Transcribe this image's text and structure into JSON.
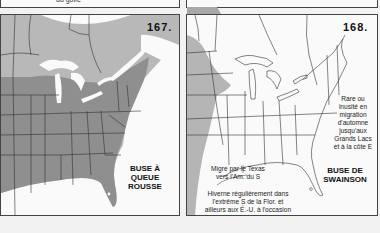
{
  "top_strip": {
    "caption": "du golfe"
  },
  "maps": [
    {
      "number": "167.",
      "species": [
        "BUSE À",
        "QUEUE",
        "ROUSSE"
      ],
      "colors": {
        "background": "#fafafa",
        "light_range": "#b8b8b8",
        "dark_range": "#8f8f8f",
        "border": "#333333"
      }
    },
    {
      "number": "168.",
      "species": [
        "BUSE DE",
        "SWAINSON"
      ],
      "notes": {
        "east_migration": [
          "Rare ou",
          "inusité en",
          "migration",
          "d'automne",
          "jusqu'aux",
          "Grands Lacs",
          "et à la côte E"
        ],
        "texas": [
          "Migre par le Texas",
          "vers l'Am. du S"
        ],
        "wintering": [
          "Hiverne régulièrement dans",
          "l'extrême S de la Flor. et",
          "ailleurs aux É.-U. à l'occasion"
        ]
      },
      "colors": {
        "background": "#fafafa",
        "range": "#b5b5b5",
        "border": "#333333"
      }
    }
  ]
}
